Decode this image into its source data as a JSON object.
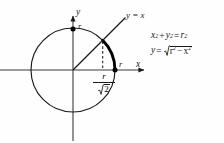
{
  "figure": {
    "name": "unit-circle-quarter-arc-diagram",
    "background_color": "#fefefe",
    "ink_color": "#1a1a1a",
    "width": 224,
    "height": 143
  },
  "axes": {
    "x_label": "x",
    "y_label": "y",
    "origin_px": [
      73,
      70
    ],
    "x_axis_from_px": [
      0,
      70
    ],
    "x_axis_to_px": [
      148,
      70
    ],
    "y_axis_from_px": [
      73,
      140
    ],
    "y_axis_to_px": [
      73,
      12
    ],
    "arrowheads": [
      "x-positive",
      "y-positive"
    ]
  },
  "circle": {
    "center_px": [
      73,
      70
    ],
    "radius_px": 42,
    "stroke_width": 1.1,
    "equation_label": "x² + y² = r²"
  },
  "highlight_arc": {
    "description": "bold arc from 45 degrees to 0 degrees",
    "start_angle_deg": 45,
    "end_angle_deg": 0,
    "stroke_width": 2.8,
    "color": "#000000"
  },
  "line_y_equals_x": {
    "label": "y = x",
    "from_px": [
      73,
      70
    ],
    "to_px": [
      125,
      18
    ],
    "slope": 1
  },
  "dashed_drop_line": {
    "x_px": 103,
    "from_y_px": 42,
    "to_y_px": 70,
    "dash_pattern": "2.5 2"
  },
  "points": [
    {
      "name": "top-of-circle",
      "px": [
        73,
        29
      ],
      "label": "r"
    },
    {
      "name": "x-intercept",
      "px": [
        115,
        70
      ],
      "label": "r"
    }
  ],
  "labels": {
    "axis_x": "x",
    "axis_y": "y",
    "radius_top": "r",
    "radius_right": "r",
    "line_equation": "y = x"
  },
  "fraction_label": {
    "numerator": "r",
    "denominator_radicand": "2",
    "denominator_symbol": "sqrt",
    "full_text": "r/√2"
  },
  "equations": {
    "circle": {
      "lhs_var1": "x",
      "exp1": "2",
      "operator_plus": "+",
      "lhs_var2": "y",
      "exp2": "2",
      "equals": "=",
      "rhs_var": "r",
      "exp3": "2",
      "full_text": "x² + y² = r²"
    },
    "function": {
      "lhs": "y",
      "equals": "=",
      "radicand_var1": "r",
      "exp1": "2",
      "operator_minus": "−",
      "radicand_var2": "x",
      "exp2": "2",
      "full_text": "y = √(r² − x²)"
    }
  },
  "icons": {
    "sqrt": "radical-icon",
    "arrow_x": "axis-arrow-right-icon",
    "arrow_y": "axis-arrow-up-icon"
  }
}
